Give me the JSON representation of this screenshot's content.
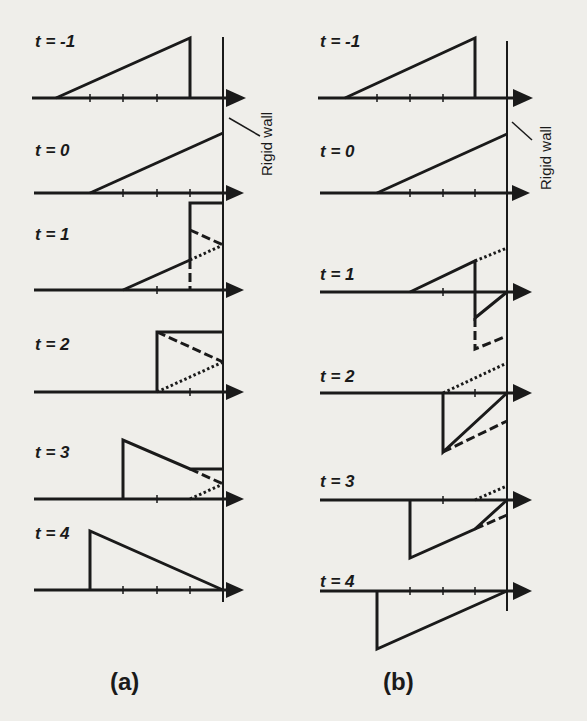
{
  "figure": {
    "panel_a": {
      "caption": "(a)",
      "wall_label": "Rigid wall",
      "rows": [
        {
          "label": "t = -1"
        },
        {
          "label": "t = 0"
        },
        {
          "label": "t = 1"
        },
        {
          "label": "t = 2"
        },
        {
          "label": "t = 3"
        },
        {
          "label": "t = 4"
        }
      ]
    },
    "panel_b": {
      "caption": "(b)",
      "wall_label": "Rigid wall",
      "rows": [
        {
          "label": "t = -1"
        },
        {
          "label": "t = 0"
        },
        {
          "label": "t = 1"
        },
        {
          "label": "t = 2"
        },
        {
          "label": "t = 3"
        },
        {
          "label": "t = 4"
        }
      ]
    },
    "colors": {
      "ink": "#1a1a1a",
      "paper": "#efeeea"
    },
    "legend_line_styles": {
      "solid": "resultant pulse",
      "dashed": "reflected pulse",
      "dotted": "incident pulse beyond wall"
    }
  }
}
